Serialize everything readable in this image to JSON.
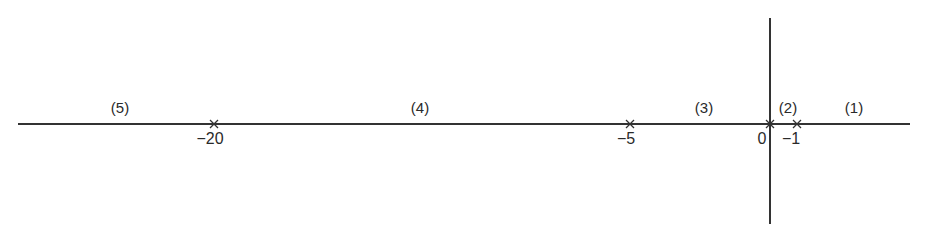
{
  "diagram": {
    "type": "root-locus-real-axis",
    "axis_color": "#333333",
    "poles": [
      {
        "label": "−20",
        "x": 214
      },
      {
        "label": "−5",
        "x": 630
      },
      {
        "label": "0",
        "x": 770
      },
      {
        "label": "−1",
        "x": 797
      }
    ],
    "regions": [
      {
        "label": "(5)",
        "x": 120
      },
      {
        "label": "(4)",
        "x": 420
      },
      {
        "label": "(3)",
        "x": 704
      },
      {
        "label": "(2)",
        "x": 788
      },
      {
        "label": "(1)",
        "x": 854
      }
    ]
  }
}
